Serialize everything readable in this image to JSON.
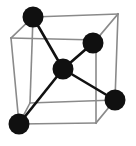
{
  "figure": {
    "name": "crystal-unit-cell-diagram",
    "type": "diagram",
    "width": 136,
    "height": 146,
    "background_color": "#ffffff",
    "atom_color": "#101010",
    "bond_color": "#111111",
    "cube_edge_color": "#8a8a8a"
  },
  "geometry": {
    "cube": {
      "description": "Wireframe cube drawn in oblique projection",
      "front_face": [
        {
          "name": "front-top-left",
          "x": 33,
          "y": 17
        },
        {
          "name": "front-top-right",
          "x": 118,
          "y": 14
        },
        {
          "name": "front-bottom-right",
          "x": 115,
          "y": 100
        },
        {
          "name": "front-bottom-left",
          "x": 30,
          "y": 103
        }
      ],
      "back_face": [
        {
          "name": "back-top-left",
          "x": 11,
          "y": 38
        },
        {
          "name": "back-top-right",
          "x": 96,
          "y": 40
        },
        {
          "name": "back-bottom-right",
          "x": 96,
          "y": 123
        },
        {
          "name": "back-bottom-left",
          "x": 19,
          "y": 124
        }
      ],
      "edges": [
        {
          "from": "front-top-left",
          "to": "front-top-right"
        },
        {
          "from": "front-top-right",
          "to": "front-bottom-right"
        },
        {
          "from": "front-bottom-right",
          "to": "front-bottom-left"
        },
        {
          "from": "front-bottom-left",
          "to": "front-top-left"
        },
        {
          "from": "back-top-left",
          "to": "back-top-right"
        },
        {
          "from": "back-top-right",
          "to": "back-bottom-right"
        },
        {
          "from": "back-bottom-right",
          "to": "back-bottom-left"
        },
        {
          "from": "back-bottom-left",
          "to": "back-top-left"
        },
        {
          "from": "front-top-left",
          "to": "back-top-left"
        },
        {
          "from": "front-top-right",
          "to": "back-top-right"
        },
        {
          "from": "front-bottom-right",
          "to": "back-bottom-right"
        },
        {
          "from": "front-bottom-left",
          "to": "back-bottom-left"
        }
      ]
    },
    "atoms": [
      {
        "id": "atom-center",
        "label": "central atom",
        "x": 63,
        "y": 69,
        "r": 10.5
      },
      {
        "id": "atom-top-left",
        "label": "upper left corner atom",
        "x": 33,
        "y": 17,
        "r": 10.5
      },
      {
        "id": "atom-upper-right",
        "label": "upper right atom",
        "x": 93,
        "y": 43,
        "r": 10.5
      },
      {
        "id": "atom-right",
        "label": "right atom",
        "x": 115,
        "y": 100,
        "r": 10.5
      },
      {
        "id": "atom-bottom-left",
        "label": "lower left atom",
        "x": 19,
        "y": 124,
        "r": 10.5
      }
    ],
    "bonds": [
      {
        "id": "bond-center-top-left",
        "from": "atom-center",
        "to": "atom-top-left"
      },
      {
        "id": "bond-center-upper-right",
        "from": "atom-center",
        "to": "atom-upper-right"
      },
      {
        "id": "bond-center-right",
        "from": "atom-center",
        "to": "atom-right"
      },
      {
        "id": "bond-center-bottom-left",
        "from": "atom-center",
        "to": "atom-bottom-left"
      }
    ]
  }
}
